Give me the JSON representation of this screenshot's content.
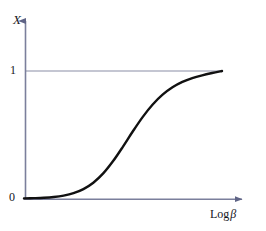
{
  "figure": {
    "name": "sigmoid-response-curve",
    "background_color": "#ffffff"
  },
  "axes": {
    "color": "#6f7390",
    "y_title": "X",
    "x_title_main": "Log",
    "x_title_symbol": "β",
    "y_ticks": [
      {
        "label": "1",
        "value": 1
      },
      {
        "label": "0",
        "value": 0
      }
    ]
  },
  "gridline": {
    "name": "asymptote-line-at-one",
    "color": "#8a8ea6",
    "value": 1
  },
  "curve": {
    "name": "sigmoid-curve",
    "color": "#111111",
    "width": 2.4
  },
  "chart_data": {
    "type": "line",
    "title": "",
    "subtitle": "",
    "xlabel": "Log β",
    "ylabel": "X",
    "xlim": [
      0,
      1
    ],
    "ylim": [
      0,
      1.08
    ],
    "grid": false,
    "legend": null,
    "axis_arrows": {
      "x": "right",
      "y": "up"
    },
    "xtick_labels": [],
    "ytick_labels": [
      "0",
      "1"
    ],
    "ytick_values": [
      0,
      1
    ],
    "annotations": [
      {
        "text": "horizontal reference line at X = 1",
        "type": "hline",
        "y": 1
      }
    ],
    "series": [
      {
        "name": "sigmoid",
        "description": "Logistic saturation curve rising from X = 0 to X = 1",
        "x": [
          0.0,
          0.05,
          0.1,
          0.15,
          0.2,
          0.25,
          0.3,
          0.35,
          0.4,
          0.45,
          0.5,
          0.55,
          0.6,
          0.65,
          0.7,
          0.75,
          0.8,
          0.85,
          0.9,
          0.95,
          1.0
        ],
        "y": [
          0.0,
          0.002,
          0.005,
          0.011,
          0.022,
          0.041,
          0.073,
          0.123,
          0.196,
          0.293,
          0.407,
          0.527,
          0.64,
          0.737,
          0.814,
          0.872,
          0.914,
          0.944,
          0.966,
          0.984,
          1.0
        ]
      }
    ]
  }
}
